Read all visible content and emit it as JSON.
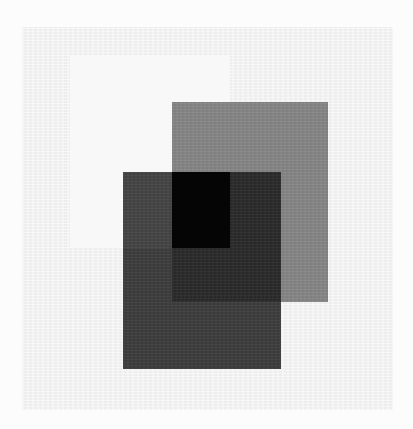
{
  "artwork": {
    "background_color": "#fcfcfc",
    "paper": {
      "x": 22,
      "y": 27,
      "w": 371,
      "h": 383,
      "color": "#f3f3f3"
    },
    "rectangles": [
      {
        "id": "light-rect",
        "x": 70,
        "y": 55,
        "w": 160,
        "h": 193,
        "color": "#f8f8f8"
      },
      {
        "id": "medium-gray-rect",
        "x": 172,
        "y": 102,
        "w": 156,
        "h": 200,
        "color": "#868686"
      },
      {
        "id": "dark-gray-rect",
        "x": 123,
        "y": 172,
        "w": 158,
        "h": 197,
        "color": "#3d3d3d"
      }
    ],
    "overlaps": [
      {
        "id": "dark-light-overlap",
        "x": 123,
        "y": 172,
        "w": 49,
        "h": 76,
        "color": "#444444"
      },
      {
        "id": "dark-medium-overlap",
        "x": 172,
        "y": 172,
        "w": 109,
        "h": 130,
        "color": "#2a2a2a"
      },
      {
        "id": "triple-overlap",
        "x": 172,
        "y": 172,
        "w": 58,
        "h": 76,
        "color": "#050505"
      }
    ]
  }
}
